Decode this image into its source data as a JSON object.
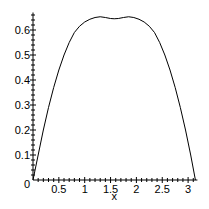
{
  "chart_data": {
    "type": "line",
    "title": "",
    "xlabel": "x",
    "ylabel": "",
    "xlim": [
      0,
      3.1416
    ],
    "ylim": [
      0,
      0.67
    ],
    "x_ticks": [
      0.5,
      1,
      1.5,
      2,
      2.5,
      3
    ],
    "x_tick_labels": [
      "0.5",
      "1",
      "1.5",
      "2",
      "2.5",
      "3"
    ],
    "y_ticks": [
      0.1,
      0.2,
      0.3,
      0.4,
      0.5,
      0.6
    ],
    "y_tick_labels": [
      "0.1",
      "0.2",
      "0.3",
      "0.4",
      "0.5",
      "0.6"
    ],
    "origin_label": "0",
    "grid": false,
    "series": [
      {
        "name": "f(x)",
        "x": [
          0,
          0.1,
          0.2,
          0.3,
          0.4,
          0.5,
          0.6,
          0.7,
          0.8,
          0.9,
          1.0,
          1.1,
          1.2,
          1.3,
          1.4,
          1.5,
          1.5708,
          1.65,
          1.75,
          1.85,
          1.95,
          2.05,
          2.15,
          2.25,
          2.35,
          2.45,
          2.55,
          2.65,
          2.75,
          2.85,
          2.95,
          3.05,
          3.1416
        ],
        "y": [
          0,
          0.1,
          0.2,
          0.29,
          0.37,
          0.44,
          0.5,
          0.55,
          0.59,
          0.615,
          0.632,
          0.643,
          0.65,
          0.653,
          0.65,
          0.646,
          0.645,
          0.646,
          0.65,
          0.653,
          0.65,
          0.643,
          0.632,
          0.615,
          0.59,
          0.55,
          0.5,
          0.44,
          0.37,
          0.29,
          0.2,
          0.1,
          0
        ]
      }
    ]
  }
}
